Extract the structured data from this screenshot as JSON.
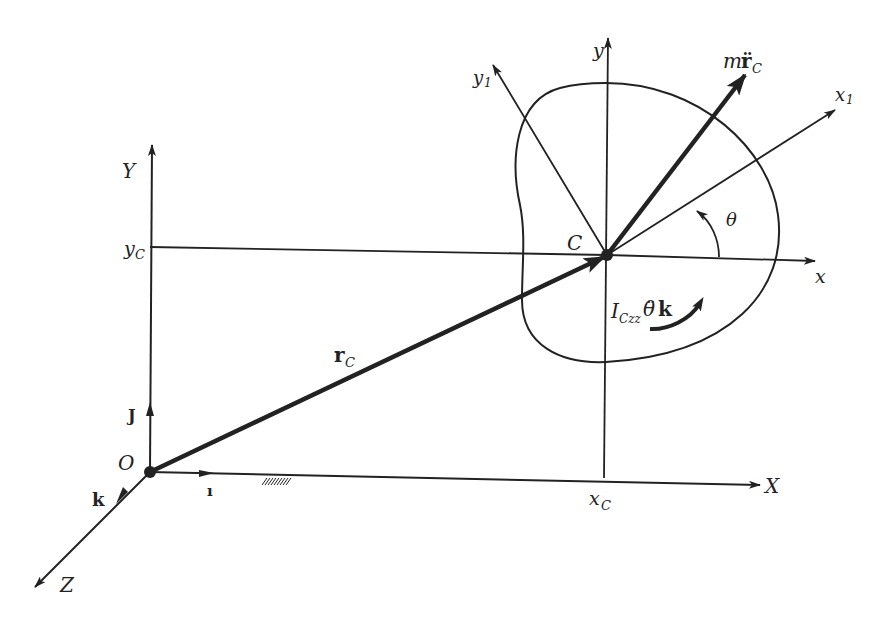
{
  "figure": {
    "labels": {
      "Y": "Y",
      "X": "X",
      "Z": "Z",
      "O": "O",
      "i": "ı",
      "j": "J",
      "k": "k",
      "yC_main": "y",
      "yC_sub": "C",
      "xC_main": "x",
      "xC_sub": "C",
      "rC_main": "r",
      "rC_sub": "C",
      "C": "C",
      "x": "x",
      "y": "y",
      "x1_main": "x",
      "x1_sub": "1",
      "y1_main": "y",
      "y1_sub": "1",
      "theta": "θ",
      "force_m": "m",
      "force_r": "r̈",
      "force_sub": "C",
      "moment_I": "I",
      "moment_sub": "Czz",
      "moment_theta": "θ̈",
      "moment_k": "k"
    },
    "colors": {
      "ink": "#222222",
      "background": "#ffffff"
    }
  }
}
